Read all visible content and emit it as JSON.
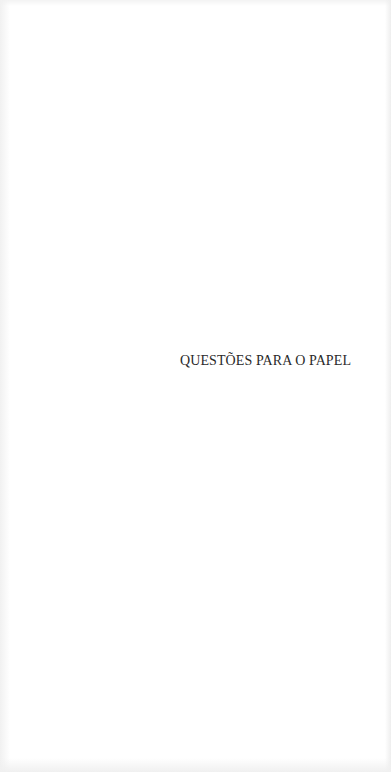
{
  "page": {
    "title": "QUESTÕES PARA O PAPEL",
    "background_color": "#ffffff",
    "text_color": "#2a2a2a"
  }
}
